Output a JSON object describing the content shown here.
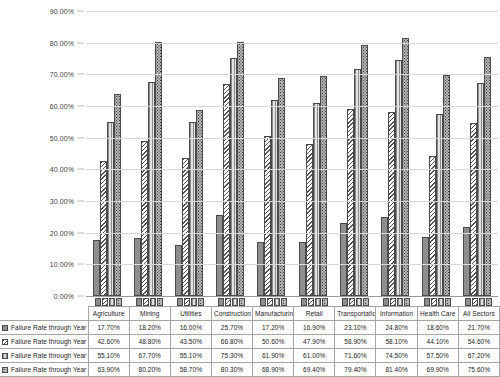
{
  "chart_data": {
    "type": "bar",
    "title": "",
    "xlabel": "",
    "ylabel": "",
    "ylim": [
      0,
      90
    ],
    "y_tick_labels": [
      "90.00%",
      "80.00%",
      "70.00%",
      "60.00%",
      "50.00%",
      "40.00%",
      "30.00%",
      "20.00%",
      "10.00%",
      "0.00%"
    ],
    "y_tick_values": [
      90,
      80,
      70,
      60,
      50,
      40,
      30,
      20,
      10,
      0
    ],
    "grid": true,
    "legend_position": "data-table",
    "categories": [
      "Agriculture",
      "Mining",
      "Utilities",
      "Construction",
      "Manufacturing",
      "Retail",
      "Transportation",
      "Information",
      "Health Care",
      "All Sectors"
    ],
    "series": [
      {
        "name": "Failure Rate through Year 1",
        "pattern": "solid-gray",
        "values": [
          17.7,
          18.2,
          16.0,
          25.7,
          17.2,
          16.9,
          23.1,
          24.8,
          18.6,
          21.7
        ],
        "labels": [
          "17.70%",
          "18.20%",
          "16.00%",
          "25.70%",
          "17.20%",
          "16.90%",
          "23.10%",
          "24.80%",
          "18.60%",
          "21.70%"
        ]
      },
      {
        "name": "Failure Rate through Year 5",
        "pattern": "diagonal-hatch",
        "values": [
          42.6,
          48.8,
          43.5,
          66.8,
          50.6,
          47.9,
          58.9,
          58.1,
          44.1,
          54.6
        ],
        "labels": [
          "42.60%",
          "48.80%",
          "43.50%",
          "66.80%",
          "50.60%",
          "47.90%",
          "58.90%",
          "58.10%",
          "44.10%",
          "54.60%"
        ]
      },
      {
        "name": "Failure Rate through Year 10",
        "pattern": "vertical-lines",
        "values": [
          55.1,
          67.7,
          55.1,
          75.3,
          61.9,
          61.0,
          71.6,
          74.5,
          57.5,
          67.2
        ],
        "labels": [
          "55.10%",
          "67.70%",
          "55.10%",
          "75.30%",
          "61.90%",
          "61.00%",
          "71.60%",
          "74.50%",
          "57.50%",
          "67.20%"
        ]
      },
      {
        "name": "Failure Rate through Year 15",
        "pattern": "dotted",
        "values": [
          63.9,
          80.2,
          58.7,
          80.3,
          68.9,
          69.4,
          79.4,
          81.4,
          69.9,
          75.6
        ],
        "labels": [
          "63.90%",
          "80.20%",
          "58.70%",
          "80.30%",
          "68.90%",
          "69.40%",
          "79.40%",
          "81.40%",
          "69.90%",
          "75.60%"
        ]
      }
    ]
  },
  "colors": {
    "series_1": "#8e8e8e",
    "series_2": "#ffffff",
    "series_3": "#d3d3d3",
    "series_4": "#b6b6b6",
    "bar_outline": "#4a4a4a",
    "gridline": "#d8d8d8",
    "axis": "#9a9a9a",
    "table_border": "#a5a5a5",
    "background": "#ffffff"
  }
}
